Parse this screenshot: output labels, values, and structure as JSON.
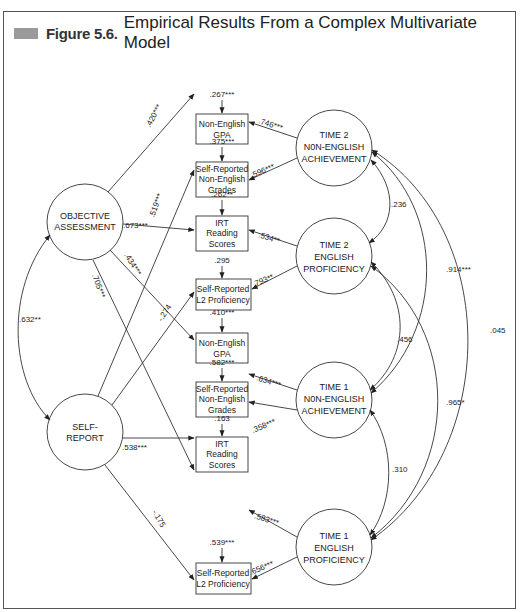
{
  "figure": {
    "label": "Figure 5.6.",
    "title": "Empirical Results From a Complex Multivariate Model",
    "marker_color": "#9a9a9a"
  },
  "latent": {
    "objective": [
      "OBJECTIVE",
      "ASSESSMENT"
    ],
    "self_report": [
      "SELF-",
      "REPORT"
    ],
    "t2_nonenglish": [
      "TIME 2",
      "N0N-ENGLISH",
      "ACHIEVEMENT"
    ],
    "t2_english": [
      "TIME 2",
      "ENGLISH",
      "PROFICIENCY"
    ],
    "t1_nonenglish": [
      "TIME 1",
      "N0N-ENGLISH",
      "ACHIEVEMENT"
    ],
    "t1_english": [
      "TIME 1",
      "ENGLISH",
      "PROFICIENCY"
    ]
  },
  "indicators": [
    {
      "lines": [
        "Non-English",
        "GPA"
      ],
      "residual": ".267***",
      "loading": ".746***"
    },
    {
      "lines": [
        "Self-Reported",
        "Non-English",
        "Grades"
      ],
      "residual": ".375***",
      "loading": ".596***"
    },
    {
      "lines": [
        "IRT",
        "Reading",
        "Scores"
      ],
      "residual": ".262**",
      "loading": ".534**"
    },
    {
      "lines": [
        "Self-Reported",
        "L2 Proficiency"
      ],
      "residual": ".295",
      "loading": ".793**"
    },
    {
      "lines": [
        "Non-English",
        "GPA"
      ],
      "residual": ".410***",
      "loading": ".634***"
    },
    {
      "lines": [
        "Self-Reported",
        "Non-English",
        "Grades"
      ],
      "residual": ".582***",
      "loading": ".358***"
    },
    {
      "lines": [
        "IRT",
        "Reading",
        "Scores"
      ],
      "residual": ".163",
      "loading": ".583***"
    },
    {
      "lines": [
        "Self-Reported",
        "L2 Proficiency"
      ],
      "residual": ".539***",
      "loading": ".656***"
    }
  ],
  "method_paths": {
    "objective_to_gpa_t2": ".420***",
    "objective_to_irt_t2": ".673***",
    "objective_to_gpa_t1": ".434***",
    "objective_to_irt_t1": ".705***",
    "self_to_grades_t2": ".519***",
    "self_to_l2_t2": "-.274",
    "self_to_grades_t1": ".538***",
    "self_to_l2_t1": "-.175"
  },
  "correlations": {
    "objective_self": ".632**",
    "t2non_t2eng": ".236",
    "t2non_t1non": ".914***",
    "t2non_t1eng": ".045",
    "t2eng_t1non": ".456",
    "t2eng_t1eng": ".965*",
    "t1non_t1eng": ".310"
  }
}
